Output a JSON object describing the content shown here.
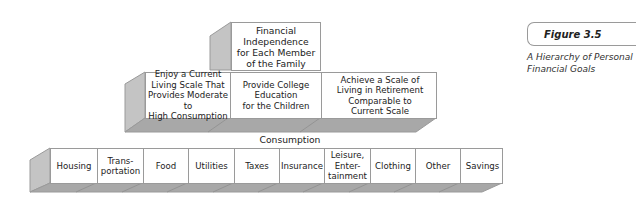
{
  "figure": {
    "label": "Figure 3.5",
    "title": "A Hierarchy of Personal\nFinancial Goals"
  },
  "pyramid": {
    "top": {
      "label": "Financial\nIndependence\nfor Each Member\nof the Family"
    },
    "middle": [
      {
        "label": "Enjoy a Current\nLiving Scale That\nProvides Moderate to\nHigh Consumption"
      },
      {
        "label": "Provide College\nEducation\nfor the Children"
      },
      {
        "label": "Achieve a Scale of\nLiving in Retirement\nComparable to\nCurrent Scale"
      }
    ],
    "base_label": "Consumption",
    "base": [
      {
        "label": "Housing"
      },
      {
        "label": "Trans-\nportation"
      },
      {
        "label": "Food"
      },
      {
        "label": "Utilities"
      },
      {
        "label": "Taxes"
      },
      {
        "label": "Insurance"
      },
      {
        "label": "Leisure,\nEnter-\ntainment"
      },
      {
        "label": "Clothing"
      },
      {
        "label": "Other"
      },
      {
        "label": "Savings"
      }
    ]
  },
  "colors": {
    "side_face": "#c4c4c4",
    "bottom_face": "#a8a8a8",
    "outline": "#9a9a9a"
  }
}
